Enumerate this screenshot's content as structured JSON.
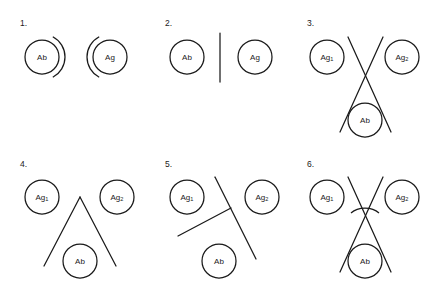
{
  "figure": {
    "background_color": "#ffffff",
    "stroke_color": "#1a1a1a",
    "width": 432,
    "height": 290
  },
  "labels": {
    "ab": "Ab",
    "ag": "Ag",
    "ag_base": "Ag",
    "ag1_sub": "1",
    "ag2_sub": "2"
  },
  "panels": [
    {
      "number": "1.",
      "number_x": 20,
      "number_y": 26,
      "nodes": [
        {
          "name": "ab",
          "label": "Ab",
          "cx": 42,
          "cy": 57,
          "r": 17
        },
        {
          "name": "ag",
          "label": "Ag",
          "cx": 110,
          "cy": 57,
          "r": 17
        }
      ],
      "shapes": [
        {
          "type": "arc",
          "name": "ab-outer-arc",
          "cx": 42,
          "cy": 57,
          "r": 23,
          "start_deg": -62,
          "end_deg": 62
        },
        {
          "type": "arc",
          "name": "ag-outer-arc",
          "cx": 110,
          "cy": 57,
          "r": 23,
          "start_deg": 118,
          "end_deg": 242
        }
      ]
    },
    {
      "number": "2.",
      "number_x": 165,
      "number_y": 26,
      "nodes": [
        {
          "name": "ab",
          "label": "Ab",
          "cx": 187,
          "cy": 57,
          "r": 17
        },
        {
          "name": "ag",
          "label": "Ag",
          "cx": 255,
          "cy": 57,
          "r": 17
        }
      ],
      "shapes": [
        {
          "type": "line",
          "name": "divider-line",
          "x1": 220,
          "y1": 33,
          "x2": 220,
          "y2": 82
        }
      ]
    },
    {
      "number": "3.",
      "number_x": 307,
      "number_y": 26,
      "nodes": [
        {
          "name": "ag1",
          "label": "Ag",
          "sub": "1",
          "cx": 327,
          "cy": 57,
          "r": 17
        },
        {
          "name": "ag2",
          "label": "Ag",
          "sub": "2",
          "cx": 402,
          "cy": 57,
          "r": 17
        },
        {
          "name": "ab",
          "label": "Ab",
          "cx": 365,
          "cy": 120,
          "r": 17
        }
      ],
      "shapes": [
        {
          "type": "line",
          "name": "cross-line-left",
          "x1": 348,
          "y1": 37,
          "x2": 391,
          "y2": 132
        },
        {
          "type": "line",
          "name": "cross-line-right",
          "x1": 383,
          "y1": 37,
          "x2": 340,
          "y2": 132
        }
      ]
    },
    {
      "number": "4.",
      "number_x": 20,
      "number_y": 167,
      "nodes": [
        {
          "name": "ag1",
          "label": "Ag",
          "sub": "1",
          "cx": 42,
          "cy": 197,
          "r": 17
        },
        {
          "name": "ag2",
          "label": "Ag",
          "sub": "2",
          "cx": 117,
          "cy": 197,
          "r": 17
        },
        {
          "name": "ab",
          "label": "Ab",
          "cx": 80,
          "cy": 261,
          "r": 17
        }
      ],
      "shapes": [
        {
          "type": "line",
          "name": "apex-line-left",
          "x1": 80,
          "y1": 197,
          "x2": 44,
          "y2": 266
        },
        {
          "type": "line",
          "name": "apex-line-right",
          "x1": 80,
          "y1": 197,
          "x2": 116,
          "y2": 266
        }
      ]
    },
    {
      "number": "5.",
      "number_x": 165,
      "number_y": 167,
      "nodes": [
        {
          "name": "ag1",
          "label": "Ag",
          "sub": "1",
          "cx": 187,
          "cy": 197,
          "r": 17
        },
        {
          "name": "ag2",
          "label": "Ag",
          "sub": "2",
          "cx": 262,
          "cy": 197,
          "r": 17
        },
        {
          "name": "ab",
          "label": "Ab",
          "cx": 219,
          "cy": 261,
          "r": 17
        }
      ],
      "shapes": [
        {
          "type": "line",
          "name": "tjunction-main-line",
          "x1": 215,
          "y1": 177,
          "x2": 256,
          "y2": 259
        },
        {
          "type": "line",
          "name": "tjunction-branch-line",
          "x1": 178,
          "y1": 236,
          "x2": 231,
          "y2": 208
        }
      ]
    },
    {
      "number": "6.",
      "number_x": 307,
      "number_y": 167,
      "nodes": [
        {
          "name": "ag1",
          "label": "Ag",
          "sub": "1",
          "cx": 327,
          "cy": 197,
          "r": 17
        },
        {
          "name": "ag2",
          "label": "Ag",
          "sub": "2",
          "cx": 402,
          "cy": 197,
          "r": 17
        },
        {
          "name": "ab",
          "label": "Ab",
          "cx": 365,
          "cy": 261,
          "r": 17
        }
      ],
      "shapes": [
        {
          "type": "line",
          "name": "cross-line-left",
          "x1": 348,
          "y1": 177,
          "x2": 391,
          "y2": 272
        },
        {
          "type": "line",
          "name": "cross-line-right",
          "x1": 383,
          "y1": 177,
          "x2": 340,
          "y2": 272
        },
        {
          "type": "bridge-arc",
          "name": "bridge-arc",
          "x1": 351,
          "y1": 213,
          "x2": 379,
          "y2": 213,
          "rx": 18,
          "ry": 13
        }
      ]
    }
  ]
}
